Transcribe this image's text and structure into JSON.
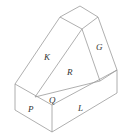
{
  "diagram": {
    "type": "isometric-solid",
    "colors": {
      "edge": "#9a9a9a",
      "label": "#333333",
      "background": "#ffffff"
    },
    "face_labels": {
      "K": "K",
      "G": "G",
      "R": "R",
      "P": "P",
      "Q": "Q",
      "L": "L"
    }
  }
}
